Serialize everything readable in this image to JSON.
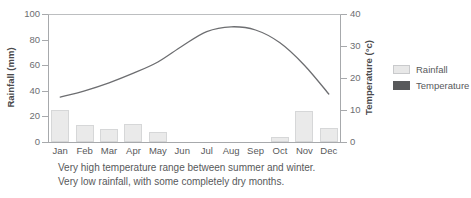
{
  "chart_data": {
    "type": "bar",
    "title": "",
    "subtitle": "",
    "categories": [
      "Jan",
      "Feb",
      "Mar",
      "Apr",
      "May",
      "Jun",
      "Jul",
      "Aug",
      "Sep",
      "Oct",
      "Nov",
      "Dec"
    ],
    "series": [
      {
        "name": "Rainfall",
        "type": "bar",
        "axis": "left",
        "unit": "mm",
        "values": [
          25,
          13,
          10,
          14,
          8,
          0,
          0,
          0,
          0,
          4,
          24,
          11
        ]
      },
      {
        "name": "Temperature",
        "type": "line",
        "axis": "right",
        "unit": "°c",
        "values": [
          14,
          16,
          18.5,
          21.5,
          25,
          30,
          34.5,
          36,
          35,
          31,
          24,
          15
        ]
      }
    ],
    "xlabel": "",
    "ylabel": "Rainfall (mm)",
    "ylabel_right": "Temperature (°c)",
    "ylim": [
      0,
      100
    ],
    "ylim_right": [
      0,
      40
    ],
    "yticks": [
      0,
      20,
      40,
      60,
      80,
      100
    ],
    "yticks_right": [
      0,
      10,
      20,
      30,
      40
    ],
    "grid": false,
    "legend_position": "right",
    "colors": {
      "bar_fill": "#eaeaea",
      "bar_border": "#d6d7d8",
      "line": "#6d6e71",
      "axis": "#a7a9ac",
      "text": "#58595b"
    },
    "annotations": [
      "Very high temperature range between summer and winter.",
      "Very low rainfall, with some completely dry months."
    ]
  },
  "axes": {
    "left": {
      "title": "Rainfall (mm)",
      "ticks": [
        "0",
        "20",
        "40",
        "60",
        "80",
        "100"
      ]
    },
    "right": {
      "title": "Temperature (°c)",
      "ticks": [
        "0",
        "10",
        "20",
        "30",
        "40"
      ]
    },
    "x": {
      "ticks": [
        "Jan",
        "Feb",
        "Mar",
        "Apr",
        "May",
        "Jun",
        "Jul",
        "Aug",
        "Sep",
        "Oct",
        "Nov",
        "Dec"
      ]
    }
  },
  "legend": {
    "items": [
      {
        "label": "Rainfall"
      },
      {
        "label": "Temperature"
      }
    ]
  },
  "caption": {
    "line1": "Very high temperature range between summer and winter.",
    "line2": "Very low rainfall, with some completely dry months."
  }
}
